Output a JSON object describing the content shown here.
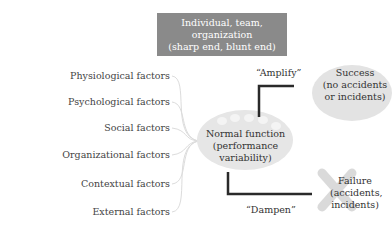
{
  "top_box": {
    "line1": "Individual, team,",
    "line2": "organization",
    "line3": "(sharp end, blunt end)"
  },
  "factors": [
    {
      "label": "Physiological factors"
    },
    {
      "label": "Psychological factors"
    },
    {
      "label": "Social factors"
    },
    {
      "label": "Organizational factors"
    },
    {
      "label": "Contextual factors"
    },
    {
      "label": "External factors"
    }
  ],
  "center": {
    "line1": "Normal function",
    "line2": "(performance",
    "line3": "variability)"
  },
  "amplify": {
    "label": "“Amplify”"
  },
  "dampen": {
    "label": "“Dampen”"
  },
  "success": {
    "line1": "Success",
    "line2": "(no accidents",
    "line3": "or incidents)"
  },
  "failure": {
    "line1": "Failure",
    "line2": "(accidents,",
    "line3": "incidents)"
  },
  "colors": {
    "top_box": "#8a8a8a",
    "ellipse": "#e4e4e4",
    "lines": "#333333",
    "fan_lines": "#d8d8d8",
    "cross": "#d9d9d9"
  }
}
